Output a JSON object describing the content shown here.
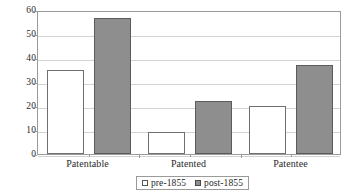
{
  "chart_data": {
    "type": "bar",
    "title": "",
    "subtitle": "",
    "xlabel": "",
    "ylabel": "",
    "categories": [
      "Patentable",
      "Patented",
      "Patentee"
    ],
    "series": [
      {
        "name": "pre-1855",
        "values": [
          35,
          9,
          20
        ],
        "color": "#ffffff",
        "swatch": "white-square-swatch"
      },
      {
        "name": "post-1855",
        "values": [
          56.5,
          22,
          37
        ],
        "color": "#8e8e8e",
        "swatch": "gray-square-swatch"
      }
    ],
    "ylim": [
      0,
      60
    ],
    "ytick_labels": [
      "60",
      "50",
      "40",
      "30",
      "20",
      "10",
      "0"
    ],
    "ytick_values": [
      60,
      50,
      40,
      30,
      20,
      10,
      0
    ],
    "grid": true,
    "grid_axis": "y",
    "legend_position": "bottom",
    "annotations": [],
    "colors": {
      "frame": "#9a9a9a",
      "gridline": "#d2d2d2",
      "bar_pre_fill": "#ffffff",
      "bar_pre_border": "#6f6f6f",
      "bar_post_fill": "#8e8e8e",
      "bar_post_border": "#5b5b5b",
      "text": "#2a2a2a",
      "background": "#ffffff"
    }
  }
}
